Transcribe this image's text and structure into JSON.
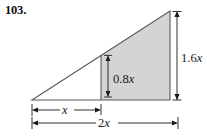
{
  "figure": {
    "number_label": "103.",
    "type": "geometry-diagram",
    "colors": {
      "shaded_fill": "#d4d4d4",
      "outline": "#4d4d4d",
      "dimension_line": "#1a1a1a",
      "background": "#ffffff",
      "label_text": "#1a1a1a"
    },
    "labels": {
      "height_right": "1.6x",
      "height_middle": "0.8x",
      "base_left": "x",
      "base_total": "2x"
    },
    "label_parts": {
      "height_right_num": "1.6",
      "height_right_var": "x",
      "height_middle_num": "0.8",
      "height_middle_var": "x",
      "base_left_var": "x",
      "base_total_num": "2",
      "base_total_var": "x"
    },
    "geometry": {
      "left_vertex": [
        32,
        100
      ],
      "apex": [
        170,
        11
      ],
      "bottom_right": [
        170,
        100
      ],
      "divider_x": 101,
      "divider_top_y": 55,
      "baseline_y": 100
    }
  }
}
